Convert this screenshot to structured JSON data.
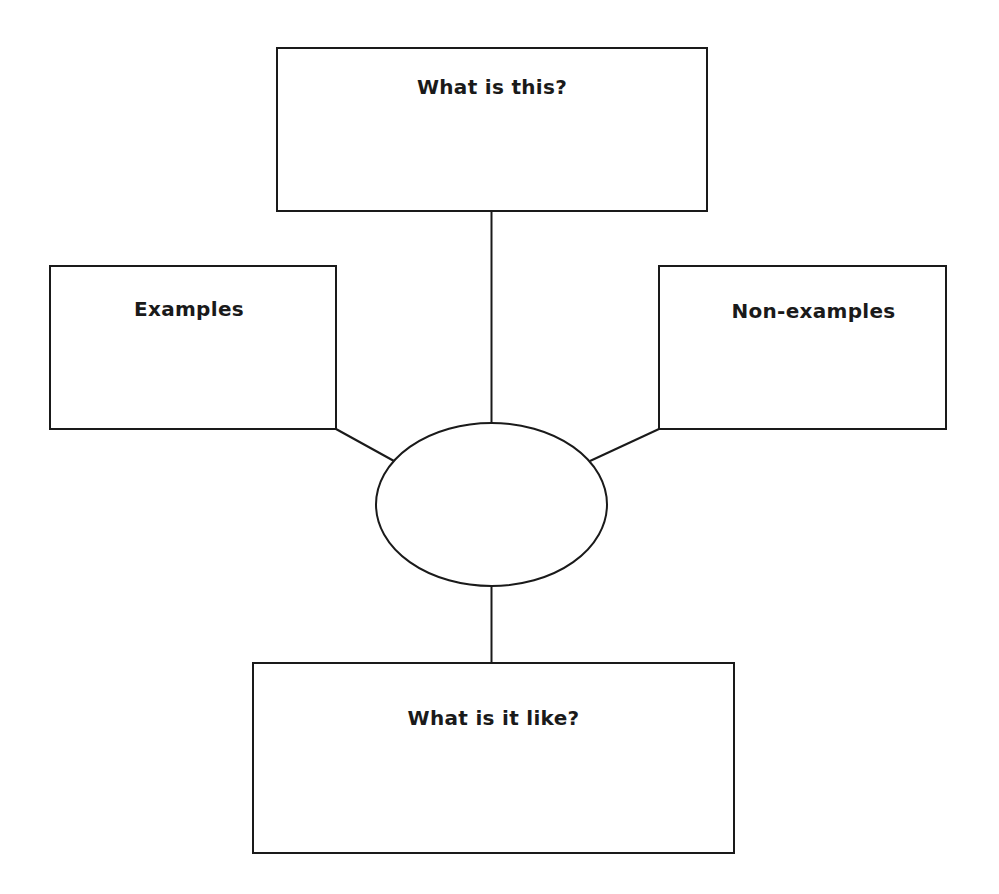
{
  "diagram": {
    "type": "concept-definition-map",
    "stroke_color": "#1a1a1a",
    "background_color": "#ffffff",
    "boxes": {
      "top": {
        "label": "What is this?"
      },
      "left": {
        "label": "Examples"
      },
      "right": {
        "label": "Non-examples"
      },
      "bottom": {
        "label": "What is it like?"
      }
    },
    "center": {
      "shape": "ellipse",
      "label": ""
    },
    "connections": [
      {
        "from": "center",
        "to": "top"
      },
      {
        "from": "center",
        "to": "left"
      },
      {
        "from": "center",
        "to": "right"
      },
      {
        "from": "center",
        "to": "bottom"
      }
    ]
  }
}
